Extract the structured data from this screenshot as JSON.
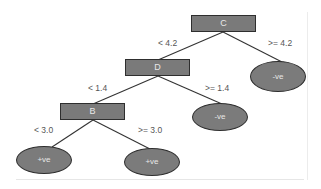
{
  "diagram": {
    "type": "decision-tree",
    "colors": {
      "node_fill": "#7a7a7a",
      "node_border": "#2e2e2e",
      "node_text": "#e8e8e8",
      "edge": "#333333",
      "label_text": "#555555"
    },
    "nodes": {
      "c": {
        "label": "C"
      },
      "d": {
        "label": "D"
      },
      "b": {
        "label": "B"
      },
      "leaf_c_right": {
        "label": "-ve"
      },
      "leaf_d_right": {
        "label": "-ve"
      },
      "leaf_b_left": {
        "label": "+ve"
      },
      "leaf_b_right": {
        "label": "+ve"
      }
    },
    "edges": {
      "c_left": {
        "label": "< 4.2"
      },
      "c_right": {
        "label": ">= 4.2"
      },
      "d_left": {
        "label": "< 1.4"
      },
      "d_right": {
        "label": ">= 1.4"
      },
      "b_left": {
        "label": "< 3.0"
      },
      "b_right": {
        "label": ">= 3.0"
      }
    }
  }
}
